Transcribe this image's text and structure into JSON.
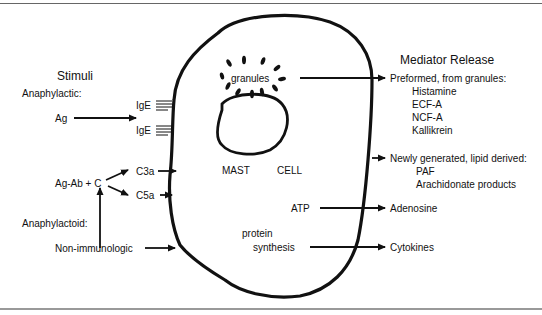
{
  "stimuli": {
    "title": "Stimuli",
    "anaphylactic_label": "Anaphylactic:",
    "ag": "Ag",
    "ige_1": "IgE",
    "ige_2": "IgE",
    "ag_ab_c": "Ag-Ab + C",
    "c3a": "C3a",
    "c5a": "C5a",
    "anaphylactoid_label": "Anaphylactoid:",
    "non_immunologic": "Non-immunologic"
  },
  "cell": {
    "granules": "granules",
    "mast": "MAST",
    "cell": "CELL",
    "atp": "ATP",
    "protein": "protein",
    "synthesis": "synthesis"
  },
  "mediators": {
    "title": "Mediator Release",
    "preformed": {
      "label": "Preformed, from granules:",
      "items": [
        "Histamine",
        "ECF-A",
        "NCF-A",
        "Kallikrein"
      ]
    },
    "newly_generated": {
      "label": "Newly generated, lipid derived:",
      "items": [
        "PAF",
        "Arachidonate products"
      ]
    },
    "adenosine": "Adenosine",
    "cytokines": "Cytokines"
  }
}
